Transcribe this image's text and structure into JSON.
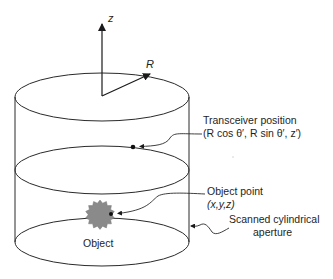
{
  "diagram": {
    "axes": {
      "z_label": "z",
      "r_label": "R"
    },
    "labels": {
      "transceiver_title": "Transceiver position",
      "transceiver_coords": "(R cos θ′, R sin θ′, z′)",
      "object_point_title": "Object point",
      "object_point_coords": "(x,y,z)",
      "object": "Object",
      "aperture_line1": "Scanned cylindrical",
      "aperture_line2": "aperture"
    },
    "colors": {
      "line": "#2a2a2a",
      "object_fill": "#8a8a8a",
      "background": "#ffffff"
    }
  }
}
